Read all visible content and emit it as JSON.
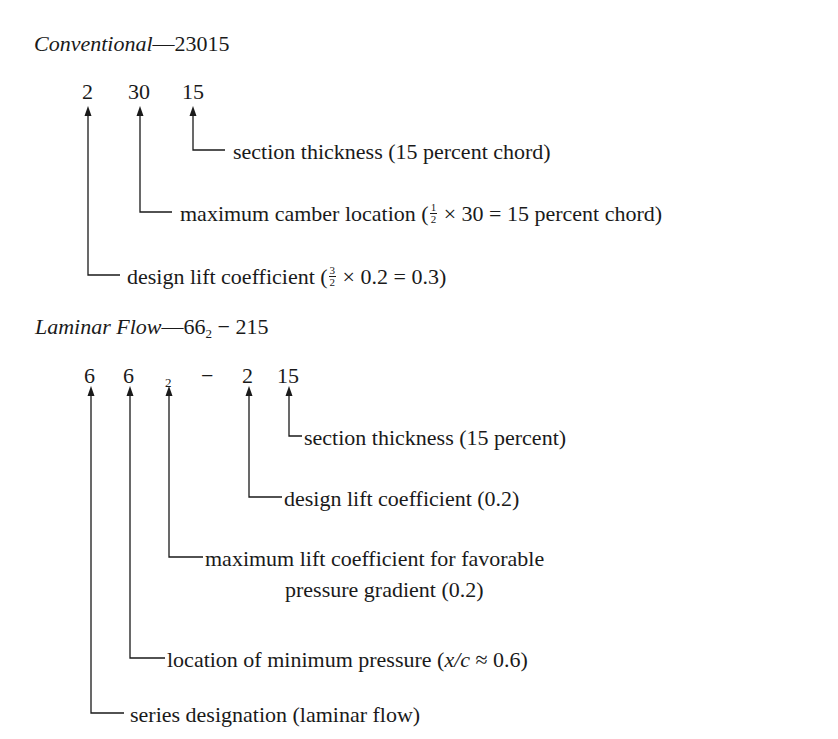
{
  "conventional": {
    "heading_label": "Conventional",
    "heading_dash": "—",
    "heading_code": "23015",
    "digits": [
      "2",
      "30",
      "15"
    ],
    "annotations": {
      "thickness": "section thickness (15 percent chord)",
      "camber_prefix": "maximum camber location (",
      "camber_frac_num": "1",
      "camber_frac_den": "2",
      "camber_suffix": " × 30 = 15 percent chord)",
      "lift_prefix": "design lift coefficient (",
      "lift_frac_num": "3",
      "lift_frac_den": "2",
      "lift_suffix": " × 0.2 = 0.3)"
    }
  },
  "laminar": {
    "heading_label": "Laminar Flow",
    "heading_dash": "—",
    "heading_code_main": "66",
    "heading_code_sub": "2",
    "heading_code_rest": " − 215",
    "digits": [
      "6",
      "6",
      "2",
      "−",
      "2",
      "15"
    ],
    "annotations": {
      "thickness": "section thickness (15 percent)",
      "design_lift": "design lift coefficient (0.2)",
      "max_lift_line1": "maximum lift coefficient for favorable",
      "max_lift_line2": "pressure gradient (0.2)",
      "min_pressure_prefix": "location of minimum pressure (",
      "min_pressure_var": "x/c",
      "min_pressure_suffix": " ≈ 0.6)",
      "series": "series designation (laminar flow)"
    }
  }
}
